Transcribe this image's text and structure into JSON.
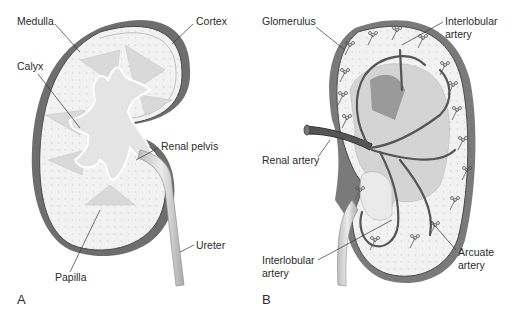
{
  "figure": {
    "panels": [
      {
        "id": "A",
        "panel_label": "A",
        "subject": "kidney internal structure",
        "labels": {
          "medulla": "Medulla",
          "cortex": "Cortex",
          "calyx": "Calyx",
          "renal_pelvis": "Renal pelvis",
          "ureter": "Ureter",
          "papilla": "Papilla"
        }
      },
      {
        "id": "B",
        "panel_label": "B",
        "subject": "kidney blood supply",
        "labels": {
          "glomerulus": "Glomerulus",
          "interlobular_artery_top_1": "Interlobular",
          "interlobular_artery_top_2": "artery",
          "renal_artery": "Renal artery",
          "interlobular_artery_bottom_1": "Interlobular",
          "interlobular_artery_bottom_2": "artery",
          "arcuate_artery_1": "Arcuate",
          "arcuate_artery_2": "artery"
        }
      }
    ],
    "colors": {
      "cortex_dark": "#6e6e6e",
      "medulla_fill": "#efefef",
      "pyramid_fill": "#d9d9d9",
      "pelvis_fill": "#e4e4e4",
      "artery": "#555555",
      "outline": "#4a4a4a"
    }
  }
}
